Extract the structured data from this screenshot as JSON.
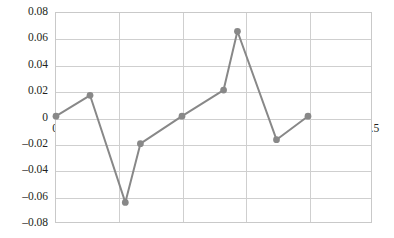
{
  "chart_data": {
    "type": "line",
    "title": "",
    "subtitle": "",
    "xlabel": "",
    "ylabel": "",
    "xlim": [
      0,
      2.5
    ],
    "ylim": [
      -0.08,
      0.08
    ],
    "grid": true,
    "legend": null,
    "legend_position": "none",
    "line_color": "#888888",
    "marker_color": "#888888",
    "marker": "circle",
    "x": [
      0,
      0.27,
      0.55,
      0.67,
      1.0,
      1.33,
      1.44,
      1.75,
      2.0
    ],
    "values": [
      0.001,
      0.017,
      -0.065,
      -0.02,
      0.001,
      0.021,
      0.066,
      -0.017,
      0.001
    ],
    "points": [
      {
        "x": 0,
        "y": 0.001
      },
      {
        "x": 0.27,
        "y": 0.017
      },
      {
        "x": 0.55,
        "y": -0.065
      },
      {
        "x": 0.67,
        "y": -0.02
      },
      {
        "x": 1.0,
        "y": 0.001
      },
      {
        "x": 1.33,
        "y": 0.021
      },
      {
        "x": 1.44,
        "y": 0.066
      },
      {
        "x": 1.75,
        "y": -0.017
      },
      {
        "x": 2.0,
        "y": 0.001
      }
    ],
    "y_ticks": [
      0.08,
      0.06,
      0.04,
      0.02,
      0,
      -0.02,
      -0.04,
      -0.06,
      -0.08
    ],
    "y_tick_labels": [
      "0.08",
      "0.06",
      "0.04",
      "0.02",
      "0",
      "–0.02",
      "–0.04",
      "–0.06",
      "–0.08"
    ],
    "x_ticks": [
      0,
      0.5,
      1,
      1.5,
      2,
      2.5
    ],
    "x_tick_labels": [
      "0",
      "0.5",
      "1",
      "1.5",
      "2",
      "2.5"
    ]
  },
  "colors": {
    "series": "#888888",
    "grid": "#cfcfcf",
    "border": "#c9c9c9",
    "text": "#231f20",
    "background": "#ffffff"
  }
}
